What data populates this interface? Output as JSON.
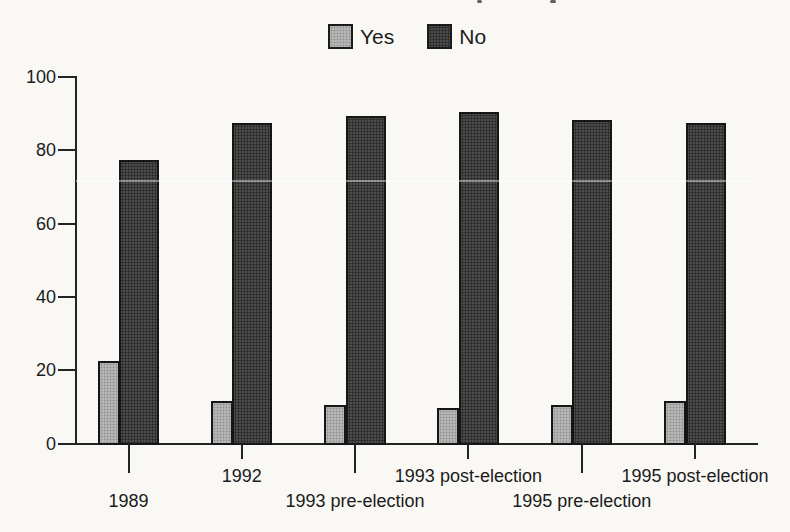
{
  "chart_data": {
    "type": "bar",
    "title": "",
    "xlabel": "",
    "ylabel": "",
    "categories": [
      "1989",
      "1992",
      "1993 pre-election",
      "1993 post-election",
      "1995 pre-election",
      "1995 post-election"
    ],
    "series": [
      {
        "name": "Yes",
        "color": "#b6b6b6",
        "values": [
          23,
          12,
          11,
          10,
          11,
          12
        ]
      },
      {
        "name": "No",
        "color": "#4c4c4c",
        "values": [
          78,
          88,
          90,
          91,
          89,
          88
        ]
      }
    ],
    "ylim": [
      0,
      100
    ],
    "yticks": [
      0,
      20,
      40,
      60,
      80,
      100
    ],
    "grid": false,
    "legend_position": "top-center",
    "x_label_layout": "staggered-two-rows",
    "bar_style": "overlapped-pair, black outline, halftone fill"
  }
}
